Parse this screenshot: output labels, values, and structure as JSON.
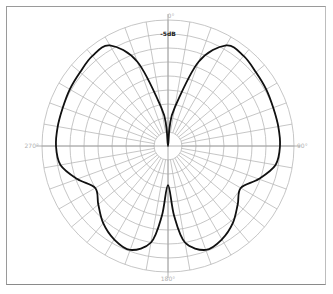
{
  "chart_data": {
    "type": "polar-line",
    "title": "",
    "angle_direction": "clockwise",
    "zero_location": "top",
    "angle_unit": "degrees",
    "angle_ticks": [
      0,
      90,
      180,
      270
    ],
    "angle_tick_labels": [
      "0°",
      "90°",
      "180°",
      "270°"
    ],
    "radial_unit": "dB",
    "radial_range": [
      -45,
      0
    ],
    "radial_rings_db": [
      -40,
      -35,
      -30,
      -25,
      -20,
      -15,
      -10,
      -5,
      0
    ],
    "radial_label": "-5dB",
    "radial_grid_step_deg": 10,
    "grid": true,
    "series": [
      {
        "name": "pattern",
        "angles": [
          0,
          5,
          10,
          20,
          30,
          40,
          50,
          60,
          70,
          80,
          90,
          100,
          110,
          120,
          130,
          140,
          150,
          160,
          170,
          175,
          180,
          185,
          190,
          200,
          210,
          220,
          230,
          240,
          250,
          260,
          270,
          280,
          290,
          300,
          310,
          320,
          330,
          340,
          350,
          355
        ],
        "values_db": [
          -45,
          -38,
          -31,
          -13,
          -3.5,
          -3,
          -4,
          -4.5,
          -5,
          -5,
          -5,
          -6,
          -10.5,
          -15,
          -12.5,
          -9,
          -6.5,
          -5.5,
          -10,
          -20,
          -31,
          -20,
          -10,
          -5.5,
          -6.5,
          -9,
          -12.5,
          -15,
          -10.5,
          -6,
          -5,
          -5,
          -5,
          -4.5,
          -4,
          -3,
          -3.5,
          -13,
          -31,
          -38
        ]
      }
    ]
  }
}
